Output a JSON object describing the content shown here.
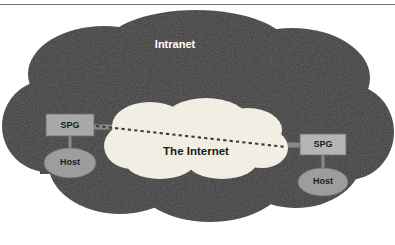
{
  "diagram": {
    "title_intranet": "Intranet",
    "title_internet": "The Internet",
    "clouds": [
      {
        "name": "intranet",
        "label": "Intranet",
        "fill": "#3d3d3d",
        "text_color": "#ffffff"
      },
      {
        "name": "internet",
        "label": "The Internet",
        "fill": "#f4f0e4",
        "text_color": "#1a1a1a"
      }
    ],
    "nodes": [
      {
        "name": "spg-left",
        "label": "SPG",
        "shape": "rectangle",
        "fill": "#a9a9a9",
        "side": "left"
      },
      {
        "name": "host-left",
        "label": "Host",
        "shape": "ellipse",
        "fill": "#9d9d9d",
        "side": "left"
      },
      {
        "name": "spg-right",
        "label": "SPG",
        "shape": "rectangle",
        "fill": "#b4b4b4",
        "side": "right"
      },
      {
        "name": "host-right",
        "label": "Host",
        "shape": "ellipse",
        "fill": "#9d9d9d",
        "side": "right"
      }
    ],
    "connectors": [
      {
        "name": "spg-left-to-host-left",
        "style": "solid",
        "color": "#8a8a8a"
      },
      {
        "name": "spg-left-to-internet",
        "style": "solid",
        "color": "#8a8a8a"
      },
      {
        "name": "internet-to-spg-right",
        "style": "solid",
        "color": "#8a8a8a"
      },
      {
        "name": "spg-right-to-host-right",
        "style": "solid",
        "color": "#8a8a8a"
      },
      {
        "name": "tunnel-path",
        "style": "dashed",
        "color": "#3a3a3a"
      }
    ],
    "colors": {
      "background": "#ffffff",
      "intranet_cloud": "#3d3d3d",
      "internet_cloud": "#f4f0e4",
      "node_gray": "#a9a9a9",
      "rule": "#6f6f6f"
    }
  }
}
